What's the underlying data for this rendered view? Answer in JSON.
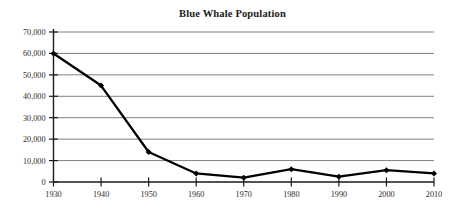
{
  "chart_data": {
    "type": "line",
    "title": "Blue Whale Population",
    "xlabel": "",
    "ylabel": "",
    "x": [
      1930,
      1940,
      1950,
      1960,
      1970,
      1980,
      1990,
      2000,
      2010
    ],
    "categories": [
      "1930",
      "1940",
      "1950",
      "1960",
      "1970",
      "1980",
      "1990",
      "2000",
      "2010"
    ],
    "values": [
      60000,
      45000,
      14000,
      4000,
      2000,
      6000,
      2500,
      5500,
      4000
    ],
    "series": [
      {
        "name": "Blue Whale Population",
        "values": [
          60000,
          45000,
          14000,
          4000,
          2000,
          6000,
          2500,
          5500,
          4000
        ]
      }
    ],
    "xlim": [
      1930,
      2010
    ],
    "ylim": [
      0,
      70000
    ],
    "ytick_values": [
      0,
      10000,
      20000,
      30000,
      40000,
      50000,
      60000,
      70000
    ],
    "ytick_labels": [
      "0",
      "10,000",
      "20,000",
      "30,000",
      "40,000",
      "50,000",
      "60,000",
      "70,000"
    ],
    "xtick_labels": [
      "1930",
      "1940",
      "1950",
      "1960",
      "1970",
      "1980",
      "1990",
      "2000",
      "2010"
    ],
    "grid": "horizontal",
    "legend": "none",
    "marker": "diamond",
    "line_color": "#000000",
    "grid_color": "#808080",
    "axis_color": "#1a1a1a",
    "background_color": "#ffffff"
  }
}
